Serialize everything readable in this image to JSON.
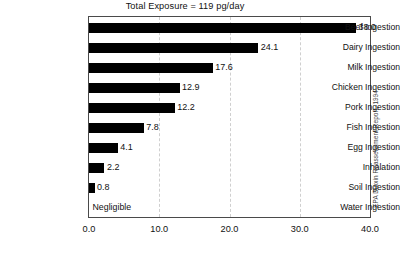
{
  "chart_data": {
    "type": "bar",
    "orientation": "horizontal",
    "title": "Total Exposure = 119 pg/day",
    "xlabel": "",
    "ylabel": "",
    "xlim": [
      0,
      40
    ],
    "grid": true,
    "legend": false,
    "xticks": [
      "0.0",
      "10.0",
      "20.0",
      "30.0",
      "40.0"
    ],
    "xtick_values": [
      0,
      10,
      20,
      30,
      40
    ],
    "categories": [
      "Beef Ingestion",
      "Dairy Ingestion",
      "Milk Ingestion",
      "Chicken Ingestion",
      "Pork Ingestion",
      "Fish Ingestion",
      "Egg Ingestion",
      "Inhalation",
      "Soil Ingestion",
      "Water Ingestion"
    ],
    "values": [
      38.0,
      24.1,
      17.6,
      12.9,
      12.2,
      7.8,
      4.1,
      2.2,
      0.8,
      0
    ],
    "value_labels": [
      "38.0",
      "24.1",
      "17.6",
      "12.9",
      "12.2",
      "7.8",
      "4.1",
      "2.2",
      "0.8",
      "Negligible"
    ],
    "bar_color": "#000000",
    "grid_color": "#cfcfcf",
    "frame_color": "#4a4a4a",
    "annotations": [
      "EPA Dioxin Reassessment Report, 1994"
    ]
  },
  "source_note": "EPA Dioxin Reassessment Report, 1994"
}
